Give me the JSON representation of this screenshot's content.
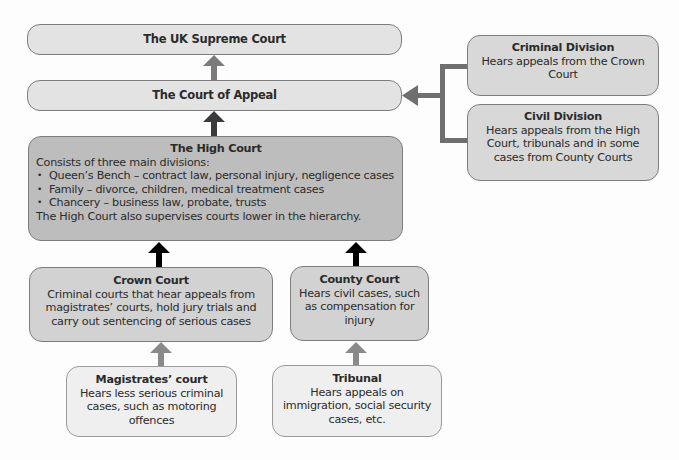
{
  "diagram": {
    "colors": {
      "supreme_fill": "#e3e3e3",
      "appeal_fill": "#e3e3e3",
      "high_fill": "#bdbdbd",
      "crown_county_fill": "#d2d2d2",
      "lower_fill": "#efefef",
      "divisions_fill": "#d8d8d8",
      "border": "#7d7d7d",
      "arrow_gray": "#7b7b7b",
      "arrow_dark": "#3a3a3a",
      "arrow_black": "#000000",
      "bracket": "#6f6f6f"
    },
    "nodes": {
      "supreme": {
        "title": "The UK Supreme Court"
      },
      "appeal": {
        "title": "The Court of Appeal"
      },
      "criminal_division": {
        "title": "Criminal Division",
        "lines": [
          "Hears appeals from the Crown",
          "Court"
        ]
      },
      "civil_division": {
        "title": "Civil Division",
        "lines": [
          "Hears appeals from the High",
          "Court, tribunals and in some",
          "cases from County Courts"
        ]
      },
      "high": {
        "title": "The High Court",
        "intro": "Consists of three main divisions:",
        "bullets": [
          "Queen’s Bench – contract law, personal injury, negligence cases",
          "Family – divorce, children, medical treatment cases",
          "Chancery – business law, probate, trusts"
        ],
        "footer": "The High Court also supervises courts lower in the hierarchy."
      },
      "crown": {
        "title": "Crown Court",
        "lines": [
          "Criminal courts that hear appeals from",
          "magistrates’ courts, hold jury trials and",
          "carry out sentencing of serious cases"
        ]
      },
      "county": {
        "title": "County Court",
        "lines": [
          "Hears civil cases, such",
          "as compensation for",
          "injury"
        ]
      },
      "magistrates": {
        "title": "Magistrates’ court",
        "lines": [
          "Hears less serious criminal",
          "cases, such as motoring",
          "offences"
        ]
      },
      "tribunal": {
        "title": "Tribunal",
        "lines": [
          "Hears appeals on",
          "immigration, social security",
          "cases, etc."
        ]
      }
    },
    "edges": [
      {
        "from": "appeal",
        "to": "supreme",
        "style": "gray"
      },
      {
        "from": "high",
        "to": "appeal",
        "style": "dark"
      },
      {
        "from": "criminal_division",
        "to": "appeal",
        "style": "bracket"
      },
      {
        "from": "civil_division",
        "to": "appeal",
        "style": "bracket"
      },
      {
        "from": "crown",
        "to": "high",
        "style": "black"
      },
      {
        "from": "county",
        "to": "high",
        "style": "black"
      },
      {
        "from": "magistrates",
        "to": "crown",
        "style": "gray"
      },
      {
        "from": "tribunal",
        "to": "county",
        "style": "gray"
      }
    ]
  }
}
